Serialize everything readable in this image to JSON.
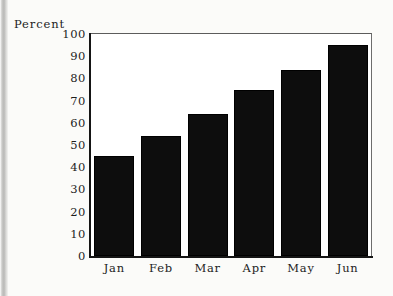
{
  "chart_data": {
    "type": "bar",
    "title": "",
    "subtitle": "",
    "xlabel": "",
    "ylabel": "Percent",
    "categories": [
      "Jan",
      "Feb",
      "Mar",
      "Apr",
      "May",
      "Jun"
    ],
    "values": [
      45,
      54,
      64,
      75,
      84,
      95
    ],
    "series": [
      {
        "name": "Percent",
        "values": [
          45,
          54,
          64,
          75,
          84,
          95
        ]
      }
    ],
    "ylim": [
      0,
      100
    ],
    "ytick_values": [
      0,
      10,
      20,
      30,
      40,
      50,
      60,
      70,
      80,
      90,
      100
    ],
    "ytick_labels": [
      "0",
      "10",
      "20",
      "30",
      "40",
      "50",
      "60",
      "70",
      "80",
      "90",
      "100"
    ],
    "grid": false,
    "legend": false,
    "legend_position": "none",
    "bar_color": "#0d0d0d",
    "plot_background": "#ffffff",
    "page_background": "#fbfbf9",
    "frame_color": "#4a4a4a",
    "axis_color": "#151515",
    "text_color": "#1d1d1d"
  }
}
